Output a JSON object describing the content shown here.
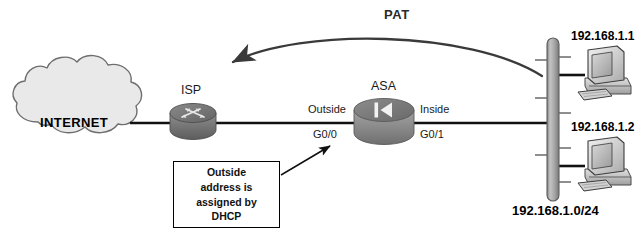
{
  "diagram": {
    "type": "network-topology",
    "title_text": "PAT",
    "nodes": {
      "cloud": {
        "label": "INTERNET"
      },
      "isp_router": {
        "label": "ISP",
        "icon": "router-icon"
      },
      "asa_firewall": {
        "label": "ASA",
        "icon": "firewall-icon"
      },
      "lan_bus": {
        "label": "192.168.1.0/24"
      },
      "host_top": {
        "ip": "192.168.1.1",
        "icon": "desktop-computer-icon"
      },
      "host_bottom": {
        "ip": "192.168.1.2",
        "icon": "desktop-computer-icon"
      }
    },
    "interfaces": {
      "outside_name": "Outside",
      "outside_port": "G0/0",
      "inside_name": "Inside",
      "inside_port": "G0/1"
    },
    "callout": {
      "line1": "Outside",
      "line2": "address is",
      "line3": "assigned by",
      "line4": "DHCP"
    },
    "colors": {
      "line": "#111111",
      "cloud_fill": "#e9e9e9",
      "cloud_stroke": "#6e6e6e",
      "device_gray_light": "#a6a6a6",
      "device_gray_dark": "#6d6d6d",
      "bus_fill": "#b0b0b0",
      "text": "#111111",
      "background": "#ffffff"
    }
  }
}
